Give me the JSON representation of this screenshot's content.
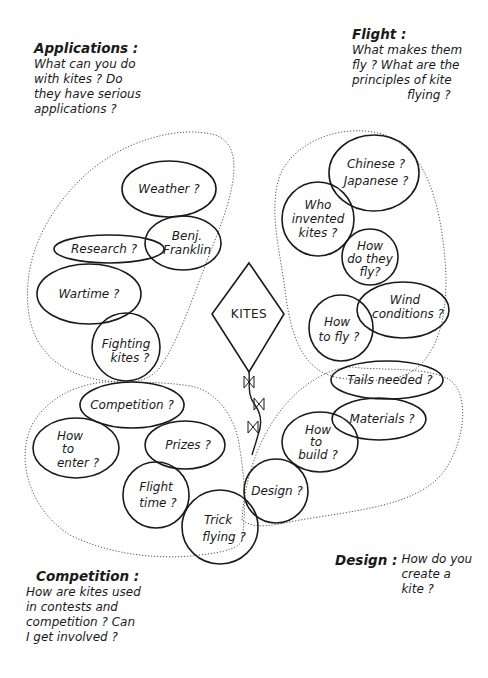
{
  "center": {
    "label": "KITES"
  },
  "sections": {
    "applications": {
      "title": "Applications :",
      "lines": [
        "What can you do",
        "with kites ?  Do",
        "they have serious",
        "applications ?"
      ]
    },
    "flight": {
      "title": "Flight :",
      "lines": [
        "What makes them",
        "fly ?  What are the",
        "principles of kite",
        "flying ?"
      ]
    },
    "competition": {
      "title": "Competition :",
      "lines": [
        "How are kites used",
        "in contests and",
        "competition ? Can",
        "I get involved ?"
      ]
    },
    "design": {
      "title": "Design :",
      "lines": [
        "How do you",
        "create a",
        "kite ?"
      ]
    }
  },
  "nodes": {
    "weather": [
      "Weather ?"
    ],
    "benj_franklin": [
      "Benj.",
      "Franklin"
    ],
    "research": [
      "Research ?"
    ],
    "wartime": [
      "Wartime ?"
    ],
    "fighting_kites": [
      "Fighting",
      "kites ?"
    ],
    "chinese_japanese": [
      "Chinese ?",
      "Japanese ?"
    ],
    "who_invented": [
      "Who",
      "invented",
      "kites ?"
    ],
    "how_do_they_fly": [
      "How",
      "do they",
      "fly?"
    ],
    "wind_conditions": [
      "Wind",
      "conditions ?"
    ],
    "how_to_fly": [
      "How",
      "to fly ?"
    ],
    "tails_needed": [
      "Tails needed ?"
    ],
    "materials": [
      "Materials ?"
    ],
    "how_to_build": [
      "How",
      "to",
      "build ?"
    ],
    "design": [
      "Design ?"
    ],
    "competition": [
      "Competition ?"
    ],
    "how_to_enter": [
      "How",
      "to",
      "enter ?"
    ],
    "prizes": [
      "Prizes ?"
    ],
    "flight_time": [
      "Flight",
      "time ?"
    ],
    "trick_flying": [
      "Trick",
      "flying ?"
    ]
  }
}
